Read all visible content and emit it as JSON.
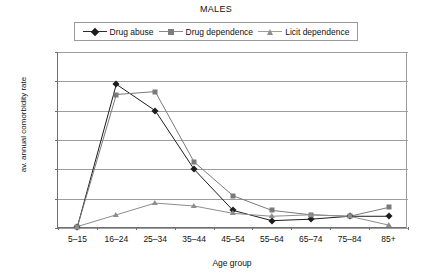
{
  "chart_data": {
    "type": "line",
    "title": "MALES",
    "xlabel": "Age group",
    "ylabel": "av. annual comorbidity rate",
    "categories": [
      "5–15",
      "16–24",
      "25–34",
      "35–44",
      "45–54",
      "55–64",
      "65–74",
      "75–84",
      "85+"
    ],
    "yticks": [
      0,
      20,
      40,
      60,
      80,
      100,
      120
    ],
    "ylim": [
      0,
      120
    ],
    "grid": true,
    "legend_position": "top-center",
    "series": [
      {
        "name": "Drug abuse",
        "marker": "diamond",
        "color": "#1c1c1c",
        "values": [
          1,
          98,
          80,
          40,
          12,
          5,
          6,
          8,
          8
        ]
      },
      {
        "name": "Drug dependence",
        "marker": "square",
        "color": "#7a7a7a",
        "values": [
          1,
          91,
          93,
          45,
          22,
          12,
          9,
          8,
          14
        ]
      },
      {
        "name": "Licit dependence",
        "marker": "triangle",
        "color": "#8d8d8d",
        "values": [
          1,
          9,
          17,
          15,
          10,
          8,
          9,
          8,
          2
        ]
      }
    ]
  },
  "legend": {
    "items": [
      {
        "label": "Drug abuse"
      },
      {
        "label": "Drug dependence"
      },
      {
        "label": "Licit dependence"
      }
    ]
  }
}
